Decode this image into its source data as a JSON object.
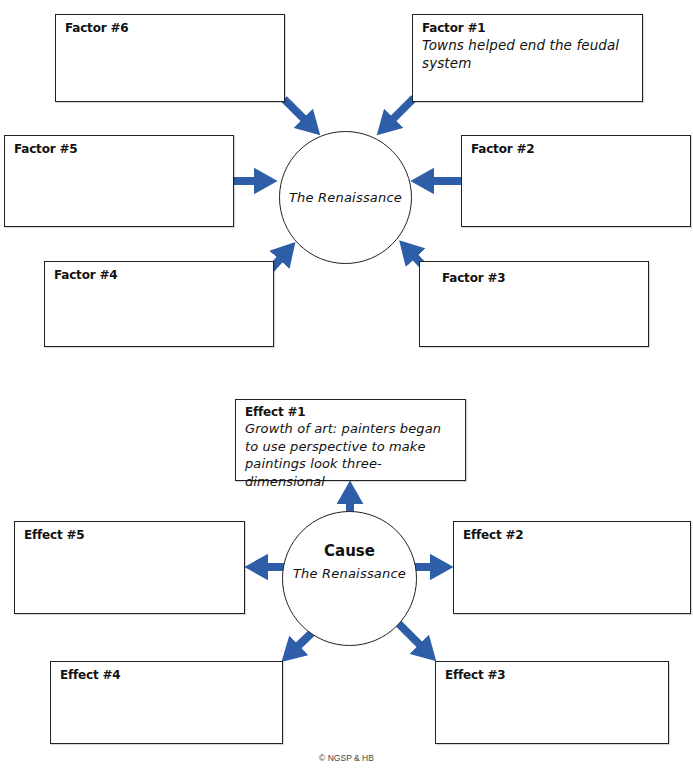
{
  "factors_diagram": {
    "center": {
      "text": "The Renaissance"
    },
    "factors": [
      {
        "label": "Factor #1",
        "content": "Towns helped end the feudal system"
      },
      {
        "label": "Factor #2",
        "content": ""
      },
      {
        "label": "Factor #3",
        "content": ""
      },
      {
        "label": "Factor #4",
        "content": ""
      },
      {
        "label": "Factor #5",
        "content": ""
      },
      {
        "label": "Factor #6",
        "content": ""
      }
    ]
  },
  "effects_diagram": {
    "center": {
      "title": "Cause",
      "text": "The Renaissance"
    },
    "effects": [
      {
        "label": "Effect #1",
        "content": "Growth of art: painters began to use perspective to make paintings look three-dimensional"
      },
      {
        "label": "Effect #2",
        "content": ""
      },
      {
        "label": "Effect #3",
        "content": ""
      },
      {
        "label": "Effect #4",
        "content": ""
      },
      {
        "label": "Effect #5",
        "content": ""
      }
    ]
  },
  "footer": {
    "copyright": "© NGSP & HB"
  },
  "colors": {
    "arrow": "#2f5ea8",
    "border": "#222222"
  }
}
